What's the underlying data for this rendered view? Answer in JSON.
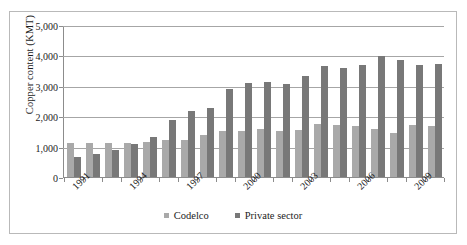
{
  "chart_data": {
    "type": "bar",
    "title": "",
    "xlabel": "",
    "ylabel": "Copper content (KMT)",
    "ylim": [
      0,
      5000
    ],
    "ytick_labels": [
      "0",
      "1,000",
      "2,000",
      "3,000",
      "4,000",
      "5,000"
    ],
    "ytick_values": [
      0,
      1000,
      2000,
      3000,
      4000,
      5000
    ],
    "grid": true,
    "legend_position": "bottom",
    "categories": [
      "1991",
      "1992",
      "1993",
      "1994",
      "1995",
      "1996",
      "1997",
      "1998",
      "1999",
      "2000",
      "2001",
      "2002",
      "2003",
      "2004",
      "2005",
      "2006",
      "2007",
      "2008",
      "2009",
      "2010"
    ],
    "visible_tick_labels": [
      "1991",
      "1994",
      "1997",
      "2000",
      "2003",
      "2006",
      "2009"
    ],
    "series": [
      {
        "name": "Codelco",
        "color": "#a9a9a9",
        "values": [
          1120,
          1140,
          1130,
          1120,
          1160,
          1210,
          1230,
          1400,
          1510,
          1520,
          1600,
          1520,
          1570,
          1750,
          1730,
          1690,
          1590,
          1470,
          1710,
          1700
        ]
      },
      {
        "name": "Private sector",
        "color": "#787878",
        "values": [
          670,
          770,
          900,
          1080,
          1320,
          1900,
          2170,
          2290,
          2900,
          3100,
          3160,
          3090,
          3350,
          3690,
          3610,
          3700,
          4000,
          3870,
          3720,
          3750
        ]
      }
    ]
  },
  "legend": {
    "entries": [
      {
        "label": "Codelco"
      },
      {
        "label": "Private sector"
      }
    ]
  }
}
